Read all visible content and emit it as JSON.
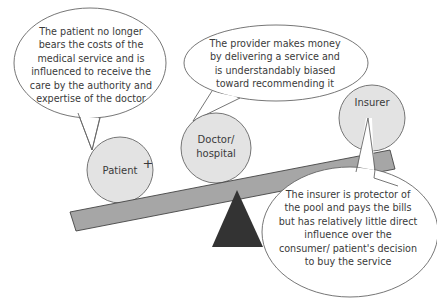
{
  "diagram": {
    "bubbles": {
      "patient": "The patient no longer bears the costs of the medical service and is influenced to receive the care by the authority and expertise of the doctor",
      "provider": "The provider makes money by delivering a service and is understandably biased toward recommending it",
      "insurer": "The insurer is protector of the pool and pays the bills but has relatively little direct influence over the consumer/ patient's decision to buy the service"
    },
    "nodes": {
      "patient": "Patient",
      "plus": "+",
      "doctor_line1": "Doctor/",
      "doctor_line2": "hospital",
      "insurer": "Insurer"
    },
    "colors": {
      "circle_fill": "#e3e3e3",
      "plank_fill": "#a6a6a6",
      "fulcrum_fill": "#333333",
      "stroke": "#555555"
    }
  }
}
